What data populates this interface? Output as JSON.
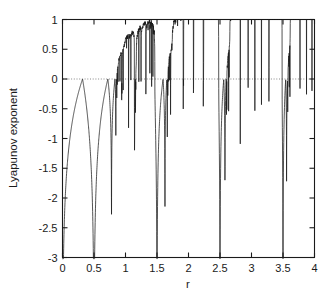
{
  "figure": {
    "background": "#ffffff",
    "ink": "#1a1a1a",
    "zeroline_color": "#7a7a7a"
  },
  "chart_data": {
    "type": "line",
    "title": "",
    "subtitle": "",
    "xlabel": "r",
    "ylabel": "Lyapunov exponent",
    "xlim": [
      0,
      4
    ],
    "ylim": [
      -3,
      1
    ],
    "grid": false,
    "legend": null,
    "zero_reference_line": {
      "y": 0,
      "style": "dotted",
      "color": "#7a7a7a"
    },
    "xticks": [
      0,
      0.5,
      1,
      1.5,
      2,
      2.5,
      3,
      3.5,
      4
    ],
    "xticklabels": [
      "0",
      "0.5",
      "1",
      "1.5",
      "2",
      "2.5",
      "3",
      "3.5",
      "4"
    ],
    "yticks": [
      -3,
      -2.5,
      -2,
      -1.5,
      -1,
      -0.5,
      0,
      0.5,
      1
    ],
    "yticklabels": [
      "-3",
      "-2.5",
      "-2",
      "-1.5",
      "-1",
      "-0.5",
      "0",
      "0.5",
      "1"
    ],
    "series": [
      {
        "name": "lyapunov exponent of sine map",
        "color": "#1a1a1a",
        "linewidth": 0.75,
        "description": "Lyapunov exponent lambda(r) for the iterated map x -> r*sin(pi*x); negative in periodic windows with sharp downward spikes at superstable parameters, crossing zero into chaos near r=3.45 and rising toward 0.7 at r=4.",
        "features": {
          "superstable_spikes_r": [
            0.0,
            2.0,
            3.236,
            3.46,
            3.54,
            3.63,
            3.7,
            3.74,
            3.83,
            3.92
          ],
          "period1_arc_peak": {
            "r": 1.0,
            "lambda": -0.03
          },
          "period2_arc_peak": {
            "r": 3.0,
            "lambda": -0.03
          },
          "chaos_onset_r": 3.45,
          "value_at_r4": 0.7,
          "max_visible_lambda": 0.7
        },
        "sampled_points": [
          {
            "r": 0.02,
            "lambda": -3.0
          },
          {
            "r": 0.05,
            "lambda": -2.6
          },
          {
            "r": 0.1,
            "lambda": -2.1
          },
          {
            "r": 0.2,
            "lambda": -1.55
          },
          {
            "r": 0.3,
            "lambda": -1.22
          },
          {
            "r": 0.4,
            "lambda": -0.97
          },
          {
            "r": 0.5,
            "lambda": -0.77
          },
          {
            "r": 0.6,
            "lambda": -0.59
          },
          {
            "r": 0.7,
            "lambda": -0.42
          },
          {
            "r": 0.8,
            "lambda": -0.27
          },
          {
            "r": 0.9,
            "lambda": -0.13
          },
          {
            "r": 1.0,
            "lambda": -0.03
          },
          {
            "r": 1.1,
            "lambda": -0.13
          },
          {
            "r": 1.2,
            "lambda": -0.27
          },
          {
            "r": 1.3,
            "lambda": -0.42
          },
          {
            "r": 1.4,
            "lambda": -0.59
          },
          {
            "r": 1.5,
            "lambda": -0.77
          },
          {
            "r": 1.6,
            "lambda": -0.97
          },
          {
            "r": 1.7,
            "lambda": -1.22
          },
          {
            "r": 1.8,
            "lambda": -1.55
          },
          {
            "r": 1.9,
            "lambda": -2.1
          },
          {
            "r": 1.97,
            "lambda": -3.0
          },
          {
            "r": 2.03,
            "lambda": -3.0
          },
          {
            "r": 2.1,
            "lambda": -2.1
          },
          {
            "r": 2.2,
            "lambda": -1.55
          },
          {
            "r": 2.3,
            "lambda": -1.25
          },
          {
            "r": 2.4,
            "lambda": -1.0
          },
          {
            "r": 2.5,
            "lambda": -0.79
          },
          {
            "r": 2.6,
            "lambda": -0.6
          },
          {
            "r": 2.7,
            "lambda": -0.43
          },
          {
            "r": 2.8,
            "lambda": -0.28
          },
          {
            "r": 2.9,
            "lambda": -0.13
          },
          {
            "r": 3.0,
            "lambda": -0.03
          },
          {
            "r": 3.05,
            "lambda": -0.1
          },
          {
            "r": 3.1,
            "lambda": -0.28
          },
          {
            "r": 3.15,
            "lambda": -0.55
          },
          {
            "r": 3.2,
            "lambda": -1.05
          },
          {
            "r": 3.236,
            "lambda": -3.0
          },
          {
            "r": 3.27,
            "lambda": -1.0
          },
          {
            "r": 3.32,
            "lambda": -0.5
          },
          {
            "r": 3.38,
            "lambda": -0.22
          },
          {
            "r": 3.43,
            "lambda": -0.06
          },
          {
            "r": 3.45,
            "lambda": 0.0
          },
          {
            "r": 3.46,
            "lambda": -0.75
          },
          {
            "r": 3.5,
            "lambda": 0.08
          },
          {
            "r": 3.54,
            "lambda": -0.55
          },
          {
            "r": 3.58,
            "lambda": 0.2
          },
          {
            "r": 3.63,
            "lambda": -0.45
          },
          {
            "r": 3.66,
            "lambda": 0.3
          },
          {
            "r": 3.7,
            "lambda": -0.4
          },
          {
            "r": 3.73,
            "lambda": 0.38
          },
          {
            "r": 3.8,
            "lambda": 0.45
          },
          {
            "r": 3.83,
            "lambda": -0.62
          },
          {
            "r": 3.88,
            "lambda": 0.5
          },
          {
            "r": 3.92,
            "lambda": -0.05
          },
          {
            "r": 3.95,
            "lambda": 0.58
          },
          {
            "r": 4.0,
            "lambda": 0.7
          }
        ]
      }
    ]
  }
}
